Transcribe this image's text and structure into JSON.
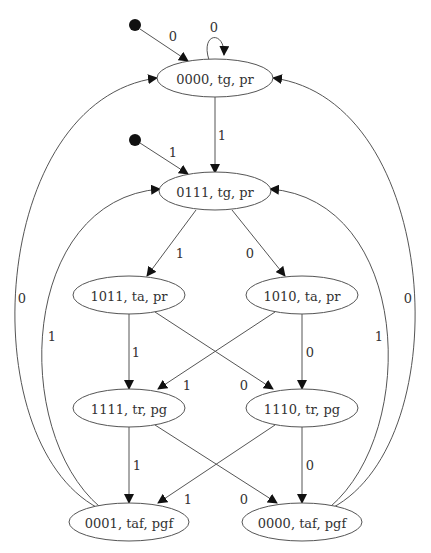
{
  "diagram": {
    "type": "state-machine",
    "nodes": [
      {
        "id": "s0",
        "label": "0000, tg, pr"
      },
      {
        "id": "s1",
        "label": "0111, tg, pr"
      },
      {
        "id": "s2",
        "label": "1011, ta, pr"
      },
      {
        "id": "s3",
        "label": "1010, ta, pr"
      },
      {
        "id": "s4",
        "label": "1111, tr, pg"
      },
      {
        "id": "s5",
        "label": "1110, tr, pg"
      },
      {
        "id": "s6",
        "label": "0001, taf, pgf"
      },
      {
        "id": "s7",
        "label": "0000, taf, pgf"
      }
    ],
    "edges": [
      {
        "from": "start0",
        "to": "s0",
        "label": "0"
      },
      {
        "from": "s0",
        "to": "s0",
        "label": "0"
      },
      {
        "from": "s0",
        "to": "s1",
        "label": "1"
      },
      {
        "from": "start1",
        "to": "s1",
        "label": "1"
      },
      {
        "from": "s1",
        "to": "s2",
        "label": "1"
      },
      {
        "from": "s1",
        "to": "s3",
        "label": "0"
      },
      {
        "from": "s2",
        "to": "s4",
        "label": "1"
      },
      {
        "from": "s2",
        "to": "s5",
        "label": "0"
      },
      {
        "from": "s3",
        "to": "s4",
        "label": "1"
      },
      {
        "from": "s3",
        "to": "s5",
        "label": "0"
      },
      {
        "from": "s4",
        "to": "s6",
        "label": "1"
      },
      {
        "from": "s4",
        "to": "s7",
        "label": "0"
      },
      {
        "from": "s5",
        "to": "s6",
        "label": "1"
      },
      {
        "from": "s5",
        "to": "s7",
        "label": "0"
      },
      {
        "from": "s6",
        "to": "s0",
        "label": "0"
      },
      {
        "from": "s6",
        "to": "s1",
        "label": "1"
      },
      {
        "from": "s7",
        "to": "s0",
        "label": "0"
      },
      {
        "from": "s7",
        "to": "s1",
        "label": "1"
      }
    ]
  }
}
